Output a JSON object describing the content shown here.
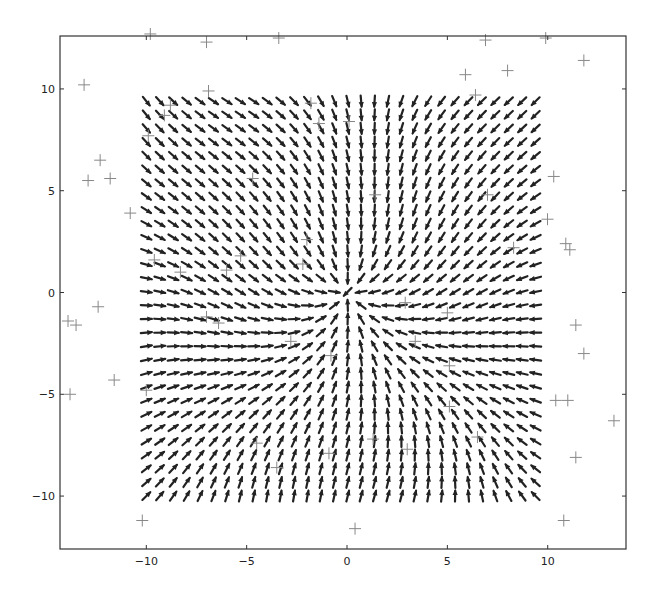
{
  "chart_data": {
    "type": "quiver",
    "title": "",
    "xlabel": "",
    "ylabel": "",
    "xlim": [
      -14.3,
      13.9
    ],
    "ylim": [
      -12.6,
      12.6
    ],
    "grid": false,
    "legend": null,
    "x_ticks": [
      -10,
      -5,
      0,
      5,
      10
    ],
    "y_ticks": [
      -10,
      -5,
      0,
      5,
      10
    ],
    "x_tick_labels": [
      "−10",
      "−5",
      "0",
      "5",
      "10"
    ],
    "y_tick_labels": [
      "−10",
      "−5",
      "0",
      "5",
      "10"
    ],
    "quiver": {
      "description": "Vector field on a 30x30 grid converging toward the origin (sink), with local distortions",
      "grid_x": {
        "start": -10.0,
        "stop": 9.4,
        "count": 30
      },
      "grid_y": {
        "start": -10.0,
        "stop": 9.4,
        "count": 30
      },
      "center": [
        0,
        0
      ],
      "direction": "inward",
      "arrow_color": "#222222",
      "arrow_length": 0.55
    },
    "series": [
      {
        "name": "sample points",
        "marker": "+",
        "color": "#888888",
        "points": [
          [
            -9.8,
            12.7
          ],
          [
            -7.0,
            12.3
          ],
          [
            -3.4,
            12.5
          ],
          [
            6.9,
            12.4
          ],
          [
            9.9,
            12.5
          ],
          [
            11.8,
            11.4
          ],
          [
            5.9,
            10.7
          ],
          [
            8.0,
            10.9
          ],
          [
            -6.9,
            9.9
          ],
          [
            6.4,
            9.7
          ],
          [
            -13.1,
            10.2
          ],
          [
            -12.9,
            5.5
          ],
          [
            -11.8,
            5.6
          ],
          [
            -12.3,
            6.5
          ],
          [
            -10.8,
            3.9
          ],
          [
            -13.9,
            -1.4
          ],
          [
            -13.5,
            -1.6
          ],
          [
            -12.4,
            -0.7
          ],
          [
            -11.6,
            -4.3
          ],
          [
            -13.8,
            -5.0
          ],
          [
            10.3,
            5.7
          ],
          [
            9.99,
            3.6
          ],
          [
            10.9,
            2.4
          ],
          [
            11.1,
            2.1
          ],
          [
            11.4,
            -1.6
          ],
          [
            11.8,
            -3.0
          ],
          [
            10.4,
            -5.3
          ],
          [
            11.0,
            -5.3
          ],
          [
            13.3,
            -6.3
          ],
          [
            11.4,
            -8.1
          ],
          [
            10.8,
            -11.2
          ],
          [
            -10.2,
            -11.2
          ],
          [
            0.4,
            -11.6
          ],
          [
            -8.8,
            9.2
          ],
          [
            -9.1,
            8.7
          ],
          [
            -9.9,
            7.7
          ],
          [
            0.1,
            8.4
          ],
          [
            -1.8,
            9.3
          ],
          [
            -1.4,
            8.3
          ],
          [
            1.4,
            4.8
          ],
          [
            -4.7,
            5.6
          ],
          [
            -2.0,
            2.6
          ],
          [
            -5.3,
            1.8
          ],
          [
            -2.2,
            1.4
          ],
          [
            -9.6,
            1.6
          ],
          [
            -8.3,
            1.0
          ],
          [
            -7.0,
            -1.2
          ],
          [
            2.9,
            -0.5
          ],
          [
            5.0,
            -1.0
          ],
          [
            3.4,
            -2.4
          ],
          [
            5.1,
            -3.6
          ],
          [
            5.1,
            -5.6
          ],
          [
            -6.0,
            1.1
          ],
          [
            -2.8,
            -2.4
          ],
          [
            -0.8,
            -3.1
          ],
          [
            -4.5,
            -7.4
          ],
          [
            -3.5,
            -8.6
          ],
          [
            -0.9,
            -7.9
          ],
          [
            3.0,
            -7.7
          ],
          [
            1.3,
            -7.2
          ],
          [
            6.5,
            -7.1
          ],
          [
            -6.4,
            -1.5
          ],
          [
            -10.0,
            -4.8
          ],
          [
            8.3,
            2.2
          ],
          [
            7.0,
            4.8
          ]
        ]
      }
    ]
  },
  "axes": {
    "frame_color": "#333333",
    "background": "#ffffff"
  }
}
